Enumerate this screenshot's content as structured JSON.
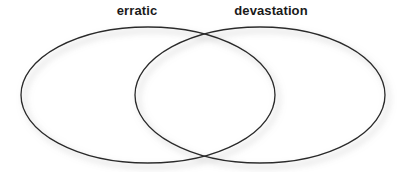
{
  "figure": {
    "type": "venn-diagram",
    "set_count": 2,
    "background_color": "#ffffff",
    "stroke_color": "#2b2b2b",
    "label_color": "#1a1a1a"
  },
  "labels": {
    "left": "erratic",
    "right": "devastation"
  },
  "circles": {
    "left": {
      "label": "erratic",
      "cx": 148,
      "cy": 95,
      "rx": 127,
      "ry": 68,
      "fill": "none"
    },
    "right": {
      "label": "devastation",
      "cx": 260,
      "cy": 95,
      "rx": 125,
      "ry": 68,
      "fill": "none"
    }
  },
  "regions": {
    "left_only": "",
    "overlap": "",
    "right_only": ""
  }
}
